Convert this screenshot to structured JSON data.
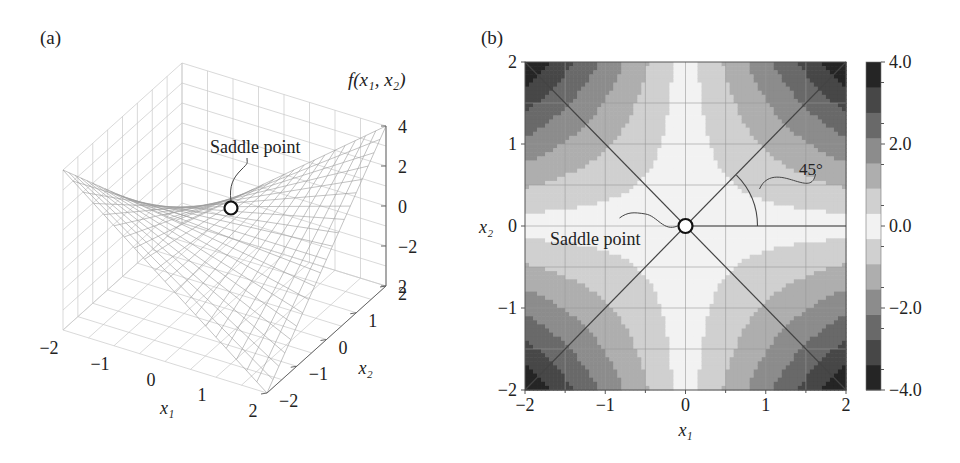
{
  "panel_a": {
    "label": "(a)",
    "zlabel": "f(x₁, x₂)",
    "annotation": "Saddle point"
  },
  "panel_b": {
    "label": "(b)",
    "annotation": "Saddle point",
    "angle_label": "45°"
  },
  "chart_data": [
    {
      "type": "surface3d",
      "title": "(a)",
      "function": "f(x1,x2) = x1*x2 (saddle)",
      "xlabel": "x1",
      "ylabel": "x2",
      "zlabel": "f(x1, x2)",
      "xticks": [
        "-2",
        "-1",
        "0",
        "1",
        "2"
      ],
      "yticks": [
        "-2",
        "-1",
        "0",
        "1",
        "2"
      ],
      "zticks": [
        "4",
        "2",
        "0",
        "-2",
        "2"
      ],
      "xlim": [
        -2,
        2
      ],
      "ylim": [
        -2,
        2
      ],
      "zlim": [
        -4,
        4
      ],
      "grid": true,
      "annotations": [
        {
          "text": "Saddle point",
          "x": 0,
          "y": 0,
          "z": 0
        }
      ]
    },
    {
      "type": "contourf",
      "title": "(b)",
      "function": "f(x1,x2) = x1*x2",
      "xlabel": "x1",
      "ylabel": "x2",
      "xticks": [
        "-2",
        "-1",
        "0",
        "1",
        "2"
      ],
      "yticks": [
        "2",
        "1",
        "0",
        "-1",
        "-2"
      ],
      "xlim": [
        -2,
        2
      ],
      "ylim": [
        -2,
        2
      ],
      "colorbar": {
        "ticks": [
          "4.0",
          "2.0",
          "0.0",
          "-2.0",
          "-4.0"
        ],
        "range": [
          -4,
          4
        ],
        "levels": 13
      },
      "grid": true,
      "lines": [
        {
          "from": [
            -2,
            -2
          ],
          "to": [
            2,
            2
          ]
        },
        {
          "from": [
            -2,
            2
          ],
          "to": [
            2,
            -2
          ]
        },
        {
          "from": [
            0,
            0
          ],
          "to": [
            2,
            0
          ]
        }
      ],
      "annotations": [
        {
          "text": "Saddle point",
          "x": 0,
          "y": 0
        },
        {
          "text": "45°",
          "angle_between": [
            "x1-axis",
            "diagonal"
          ]
        }
      ]
    }
  ]
}
